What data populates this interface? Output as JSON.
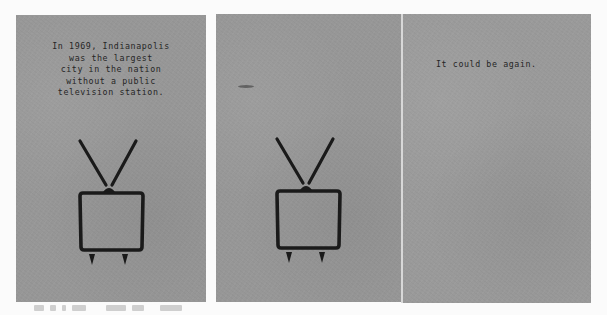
{
  "image": {
    "description": "Three-panel printed mailer on gray recycled paper with retro TV illustrations",
    "background_color": "#fbfbfb",
    "paper_color": "#979797",
    "ink_color": "#1a1a1a"
  },
  "panels": [
    {
      "id": "panel-1",
      "text": "In 1969, Indianapolis\nwas the largest\ncity in the nation\nwithout a public\ntelevision station.",
      "illustration": "tv-icon"
    },
    {
      "id": "panel-2",
      "text": "",
      "illustration": "tv-icon"
    },
    {
      "id": "panel-3",
      "text": "It could be again.",
      "illustration": ""
    }
  ],
  "caption": {
    "legible": false
  }
}
